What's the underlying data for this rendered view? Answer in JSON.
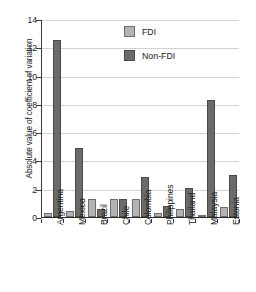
{
  "chart_data": {
    "type": "bar",
    "title": "",
    "xlabel": "",
    "ylabel": "Absolute value of coefficient of variation",
    "ylim": [
      0,
      14
    ],
    "yticks": [
      0,
      2,
      4,
      6,
      8,
      10,
      12,
      14
    ],
    "grid": true,
    "legend_position": "top-center",
    "categories": [
      "Argentina",
      "Mexico",
      "Brazil",
      "Chile",
      "Colombia",
      "Philippines",
      "Thailand",
      "Malaysia",
      "Estonia"
    ],
    "series": [
      {
        "name": "FDI",
        "color": "#b4b4b4",
        "values": [
          0.25,
          0.45,
          1.25,
          1.3,
          1.3,
          0.3,
          0.55,
          0.17,
          0.7
        ]
      },
      {
        "name": "Non-FDI",
        "color": "#6b6b6b",
        "values": [
          12.55,
          4.9,
          0.55,
          1.3,
          2.8,
          0.75,
          2.05,
          8.3,
          2.95
        ]
      }
    ]
  },
  "legend": {
    "items": [
      {
        "label": "FDI"
      },
      {
        "label": "Non-FDI"
      }
    ]
  },
  "colors": {
    "fdi": "#b4b4b4",
    "non_fdi": "#6b6b6b",
    "axis": "#2b2b2b",
    "grid": "#d2d2d2",
    "text": "#1a1a1a",
    "background": "#ffffff"
  }
}
